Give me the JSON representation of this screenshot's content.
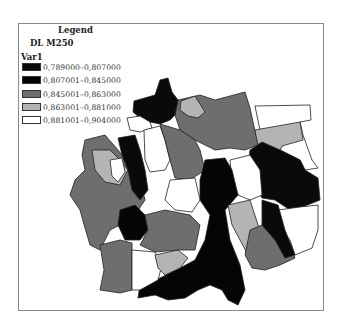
{
  "legend": {
    "title": "Legend",
    "layer": "DL M250",
    "field": "Var1",
    "items": [
      {
        "label": "0,789000–0,807000",
        "color": "#0a0a0a"
      },
      {
        "label": "0,807001–0,845000",
        "color": "#050505"
      },
      {
        "label": "0,845001–0,863000",
        "color": "#6e6e6e"
      },
      {
        "label": "0,863001–0,881000",
        "color": "#b4b4b4"
      },
      {
        "label": "0,881001–0,904000",
        "color": "#ffffff"
      }
    ]
  },
  "colors": {
    "class1": "#0a0a0a",
    "class2": "#050505",
    "class3": "#6e6e6e",
    "class4": "#b4b4b4",
    "class5": "#ffffff",
    "outline": "#222222",
    "frame": "#8a8a8a"
  }
}
